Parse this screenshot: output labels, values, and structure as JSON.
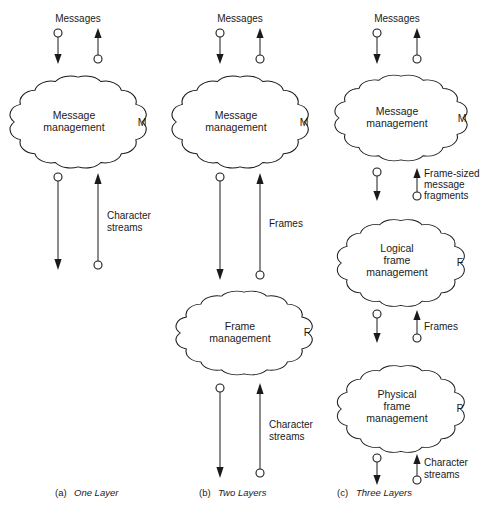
{
  "figure": {
    "background_color": "#ffffff",
    "line_color": "#1a1a1a"
  },
  "panels": [
    {
      "id": "a",
      "caption_tag": "(a)",
      "caption_text": "One Layer",
      "top_label": "Messages",
      "nodes": [
        {
          "name": "message-management",
          "lines": [
            "Message",
            "management"
          ],
          "tag": "M"
        }
      ],
      "flows": [
        {
          "name": "messages",
          "label": "Messages",
          "position": "top"
        },
        {
          "name": "character-streams",
          "label_lines": [
            "Character",
            "streams"
          ],
          "position": "bottom"
        }
      ]
    },
    {
      "id": "b",
      "caption_tag": "(b)",
      "caption_text": "Two Layers",
      "top_label": "Messages",
      "nodes": [
        {
          "name": "message-management",
          "lines": [
            "Message",
            "management"
          ],
          "tag": "M"
        },
        {
          "name": "frame-management",
          "lines": [
            "Frame",
            "management"
          ],
          "tag": "F"
        }
      ],
      "flows": [
        {
          "name": "messages",
          "label": "Messages",
          "position": "top"
        },
        {
          "name": "frames",
          "label_lines": [
            "Frames"
          ],
          "position": "middle"
        },
        {
          "name": "character-streams",
          "label_lines": [
            "Character",
            "streams"
          ],
          "position": "bottom"
        }
      ]
    },
    {
      "id": "c",
      "caption_tag": "(c)",
      "caption_text": "Three Layers",
      "top_label": "Messages",
      "nodes": [
        {
          "name": "message-management",
          "lines": [
            "Message",
            "management"
          ],
          "tag": "M"
        },
        {
          "name": "logical-frame-management",
          "lines": [
            "Logical",
            "frame",
            "management"
          ],
          "tag": "F"
        },
        {
          "name": "physical-frame-management",
          "lines": [
            "Physical",
            "frame",
            "management"
          ],
          "tag": "P"
        }
      ],
      "flows": [
        {
          "name": "messages",
          "label": "Messages",
          "position": "top"
        },
        {
          "name": "frame-sized-message-fragments",
          "label_lines": [
            "Frame-sized",
            "message",
            "fragments"
          ],
          "position": "upper-middle"
        },
        {
          "name": "frames",
          "label_lines": [
            "Frames"
          ],
          "position": "lower-middle"
        },
        {
          "name": "character-streams",
          "label_lines": [
            "Character",
            "streams"
          ],
          "position": "bottom"
        }
      ]
    }
  ],
  "text": {
    "messages": "Messages",
    "message": "Message",
    "management": "management",
    "frame": "Frame",
    "frame_lower": "frame",
    "logical": "Logical",
    "physical": "Physical",
    "frames": "Frames",
    "character": "Character",
    "streams": "streams",
    "frame_sized": "Frame-sized",
    "message_lower": "message",
    "fragments": "fragments",
    "tag_m": "M",
    "tag_f": "F",
    "tag_p": "P",
    "cap_a_tag": "(a)",
    "cap_a_text": "One Layer",
    "cap_b_tag": "(b)",
    "cap_b_text": "Two Layers",
    "cap_c_tag": "(c)",
    "cap_c_text": "Three Layers"
  }
}
